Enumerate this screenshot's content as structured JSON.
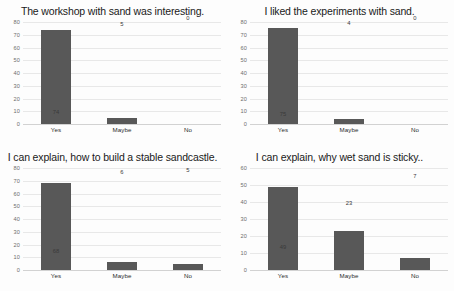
{
  "page": {
    "background_color": "#fdfdfd",
    "bar_color": "#585858",
    "gridline_color": "#e8e8e8",
    "axis_label_color": "#6d6d6d"
  },
  "chart_data": [
    {
      "type": "bar",
      "title": "The workshop with sand was interesting.",
      "categories": [
        "Yes",
        "Maybe",
        "No"
      ],
      "values": [
        74,
        5,
        0
      ],
      "xlabel": "",
      "ylabel": "",
      "ylim": [
        0,
        80
      ],
      "yticks": [
        0,
        10,
        20,
        30,
        40,
        50,
        60,
        70,
        80
      ],
      "grid": true,
      "legend": false
    },
    {
      "type": "bar",
      "title": "I liked the experiments with sand.",
      "categories": [
        "Yes",
        "Maybe",
        "No"
      ],
      "values": [
        75,
        4,
        0
      ],
      "xlabel": "",
      "ylabel": "",
      "ylim": [
        0,
        80
      ],
      "yticks": [
        0,
        10,
        20,
        30,
        40,
        50,
        60,
        70,
        80
      ],
      "grid": true,
      "legend": false
    },
    {
      "type": "bar",
      "title": "I can explain, how to build a stable sandcastle.",
      "categories": [
        "Yes",
        "Maybe",
        "No"
      ],
      "values": [
        68,
        6,
        5
      ],
      "xlabel": "",
      "ylabel": "",
      "ylim": [
        0,
        80
      ],
      "yticks": [
        0,
        10,
        20,
        30,
        40,
        50,
        60,
        70,
        80
      ],
      "grid": true,
      "legend": false
    },
    {
      "type": "bar",
      "title": "I can explain, why wet sand is sticky..",
      "categories": [
        "Yes",
        "Maybe",
        "No"
      ],
      "values": [
        49,
        23,
        7
      ],
      "xlabel": "",
      "ylabel": "",
      "ylim": [
        0,
        60
      ],
      "yticks": [
        0,
        10,
        20,
        30,
        40,
        50,
        60
      ],
      "grid": true,
      "legend": false
    }
  ]
}
